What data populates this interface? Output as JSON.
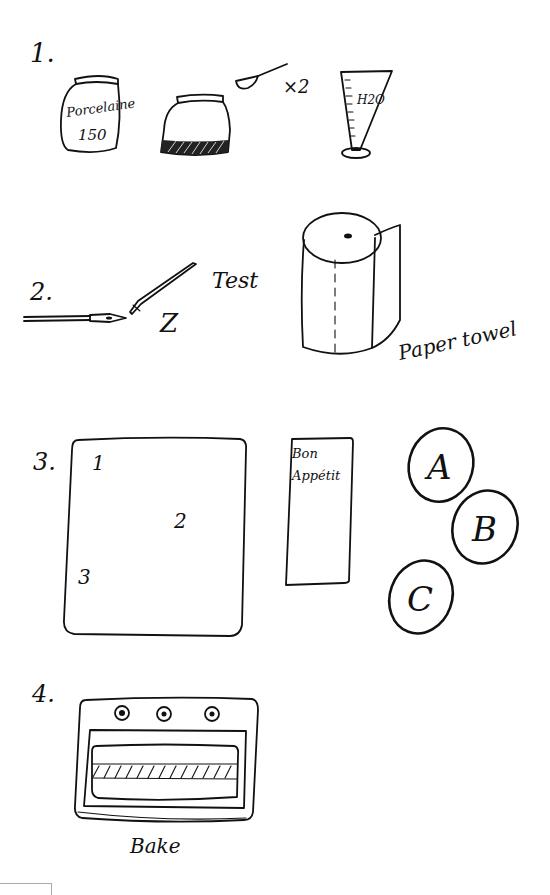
{
  "steps": [
    {
      "number": "1.",
      "items": {
        "porcelain_jar_label_line1": "Porcelaine",
        "porcelain_jar_label_line2": "150",
        "spoon_multiplier": "×2",
        "measuring_cup_label": "H2O"
      }
    },
    {
      "number": "2.",
      "items": {
        "test_label": "Test",
        "stroke_sample": "Z",
        "paper_towel_label": "Paper towel"
      }
    },
    {
      "number": "3.",
      "items": {
        "sheet_marks": [
          "1",
          "2",
          "3"
        ],
        "card_label_line1": "Bon",
        "card_label_line2": "Appétit",
        "coasters": [
          "A",
          "B",
          "C"
        ]
      }
    },
    {
      "number": "4.",
      "items": {
        "oven_label": "Bake"
      }
    }
  ],
  "colors": {
    "ink": "#111111",
    "background": "#ffffff"
  }
}
